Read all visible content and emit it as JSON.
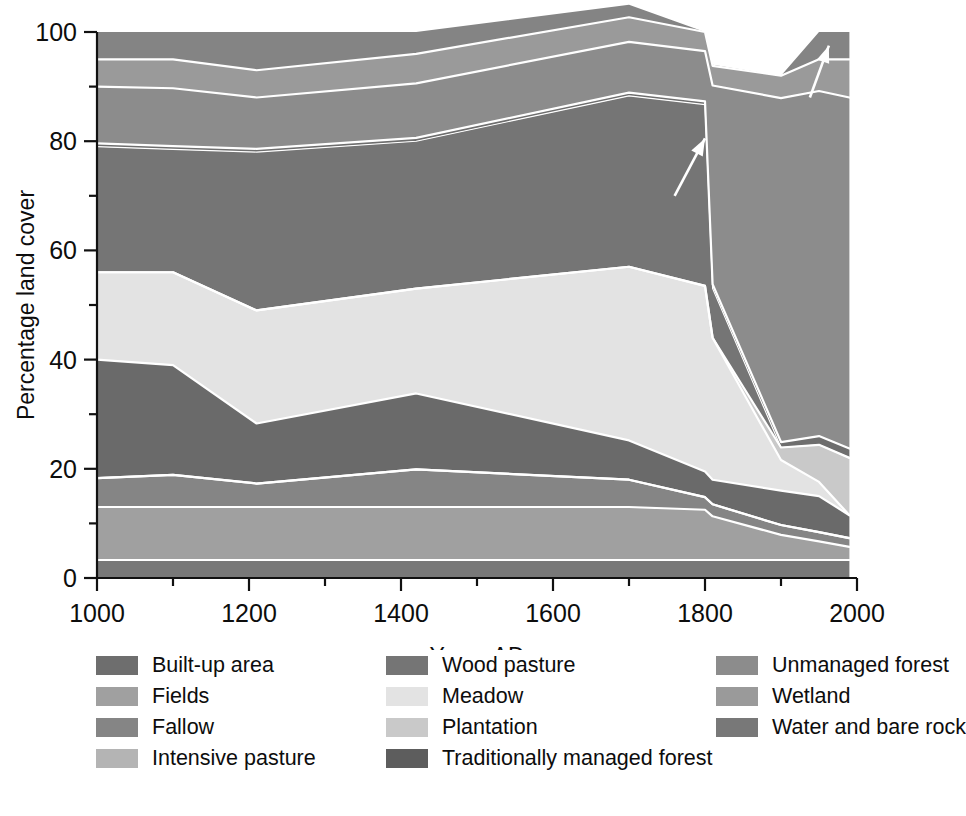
{
  "chart_data": {
    "type": "area",
    "stacked": true,
    "title": "",
    "xlabel": "Years AD",
    "ylabel": "Percentage land cover",
    "xlim": [
      1000,
      2000
    ],
    "ylim": [
      0,
      100
    ],
    "x_major_ticks": [
      1000,
      1200,
      1400,
      1600,
      1800,
      2000
    ],
    "x_minor_ticks": [
      1100,
      1300,
      1500,
      1700,
      1900
    ],
    "y_major_ticks": [
      0,
      20,
      40,
      60,
      80,
      100
    ],
    "y_minor_ticks": [
      10,
      30,
      50,
      70,
      90
    ],
    "x_tick_labels": [
      "1000",
      "1200",
      "1400",
      "1600",
      "1800",
      "2000"
    ],
    "y_tick_labels": [
      "0",
      "20",
      "40",
      "60",
      "80",
      "100"
    ],
    "grid": false,
    "legend_position": "below",
    "x": [
      1000,
      1100,
      1210,
      1420,
      1700,
      1800,
      1810,
      1900,
      1950,
      1990
    ],
    "series": [
      {
        "name": "Water and bare rock",
        "color": "#787878",
        "values": [
          3.3,
          3.3,
          3.3,
          3.3,
          3.3,
          3.3,
          3.3,
          3.3,
          3.3,
          3.3
        ]
      },
      {
        "name": "Fields",
        "color": "#a0a0a0",
        "values": [
          9.7,
          9.7,
          9.7,
          9.7,
          9.7,
          9.2,
          8.0,
          4.6,
          3.4,
          2.4
        ]
      },
      {
        "name": "Fallow",
        "color": "#858585",
        "values": [
          5.3,
          5.9,
          4.3,
          6.9,
          5.0,
          2.3,
          2.2,
          1.8,
          1.7,
          1.6
        ]
      },
      {
        "name": "Intensive pasture",
        "color": "#b4b4b4",
        "values": [
          0.0,
          0.0,
          0.0,
          0.0,
          0.0,
          0.0,
          0.0,
          0.0,
          0.0,
          0.0
        ]
      },
      {
        "name": "Traditionally managed forest",
        "color": "#6a6a6a",
        "values": [
          21.7,
          20.1,
          11.0,
          13.9,
          7.2,
          4.7,
          4.5,
          6.3,
          6.6,
          4.2
        ]
      },
      {
        "name": "Meadow",
        "color": "#e3e3e3",
        "values": [
          16.0,
          17.0,
          20.7,
          19.2,
          31.8,
          34.0,
          26.0,
          5.6,
          2.6,
          0.0
        ]
      },
      {
        "name": "Plantation",
        "color": "#c9c9c9",
        "values": [
          0.0,
          0.0,
          0.0,
          0.0,
          0.0,
          0.0,
          0.0,
          2.3,
          6.8,
          10.5
        ]
      },
      {
        "name": "Wood pasture",
        "color": "#757575",
        "values": [
          23.0,
          22.5,
          29.0,
          27.0,
          31.3,
          33.2,
          9.0,
          0.0,
          0.0,
          0.0
        ]
      },
      {
        "name": "Built-up area",
        "color": "#6e6e6e",
        "values": [
          0.6,
          0.6,
          0.6,
          0.6,
          0.6,
          0.6,
          0.8,
          1.0,
          1.6,
          1.7
        ]
      },
      {
        "name": "Unmanaged forest",
        "color": "#8c8c8c",
        "values": [
          10.4,
          10.6,
          9.4,
          10.0,
          9.3,
          9.2,
          36.4,
          63.0,
          63.2,
          64.3
        ]
      },
      {
        "name": "Wetland",
        "color": "#9a9a9a",
        "values": [
          5.0,
          5.3,
          5.0,
          5.4,
          4.5,
          3.5,
          3.6,
          4.1,
          5.8,
          7.0
        ]
      },
      {
        "name": "Water and bare rock (top)",
        "color": "#848484",
        "values": [
          5.0,
          5.0,
          7.0,
          4.0,
          2.3,
          0.0,
          0.2,
          0.0,
          5.0,
          5.0
        ]
      }
    ],
    "annotations": [
      {
        "name": "arrow-built-up",
        "tip_x": 1800,
        "tip_y": 80.5,
        "tail_x": 1760,
        "tail_y": 70.0
      },
      {
        "name": "arrow-top-band",
        "tip_x": 1963,
        "tip_y": 97.5,
        "tail_x": 1938,
        "tail_y": 88.0
      }
    ]
  },
  "axes": {
    "y_label": "Percentage land cover",
    "x_label": "Years AD"
  },
  "legend": {
    "columns": [
      [
        {
          "label": "Built-up area",
          "color": "#6e6e6e",
          "key": "built-up-area"
        },
        {
          "label": "Fields",
          "color": "#a0a0a0",
          "key": "fields"
        },
        {
          "label": "Fallow",
          "color": "#858585",
          "key": "fallow"
        },
        {
          "label": "Intensive pasture",
          "color": "#b4b4b4",
          "key": "intensive-pasture"
        }
      ],
      [
        {
          "label": "Wood pasture",
          "color": "#757575",
          "key": "wood-pasture"
        },
        {
          "label": "Meadow",
          "color": "#e3e3e3",
          "key": "meadow"
        },
        {
          "label": "Plantation",
          "color": "#c9c9c9",
          "key": "plantation"
        },
        {
          "label": "Traditionally managed forest",
          "color": "#5d5d5d",
          "key": "traditionally-managed-forest"
        }
      ],
      [
        {
          "label": "Unmanaged forest",
          "color": "#8c8c8c",
          "key": "unmanaged-forest"
        },
        {
          "label": "Wetland",
          "color": "#9a9a9a",
          "key": "wetland"
        },
        {
          "label": "Water and bare rock",
          "color": "#787878",
          "key": "water-and-bare-rock"
        }
      ]
    ]
  }
}
